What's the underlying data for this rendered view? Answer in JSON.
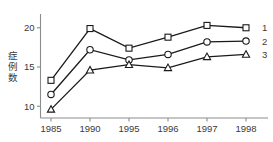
{
  "chart_data": {
    "type": "line",
    "title": "",
    "xlabel": "",
    "ylabel": "症例数",
    "categories": [
      "1985",
      "1990",
      "1995",
      "1996",
      "1997",
      "1998"
    ],
    "ylim": [
      8.5,
      21.5
    ],
    "yticks": [
      10,
      15,
      20
    ],
    "ytick_labels": [
      "10",
      "15",
      "20"
    ],
    "grid": false,
    "legend_position": "right",
    "series": [
      {
        "name": "1",
        "marker": "square",
        "values": [
          13.3,
          19.9,
          17.4,
          18.8,
          20.3,
          20.0
        ]
      },
      {
        "name": "2",
        "marker": "circle",
        "values": [
          11.5,
          17.2,
          15.9,
          16.6,
          18.2,
          18.3
        ]
      },
      {
        "name": "3",
        "marker": "triangle",
        "values": [
          9.6,
          14.6,
          15.3,
          14.9,
          16.3,
          16.6
        ]
      }
    ],
    "colors": {
      "line": "#1a1a1a",
      "marker_fill": "#ffffff",
      "axis": "#8c8c8c",
      "text": "#3a3a3a",
      "background": "#ffffff"
    }
  }
}
